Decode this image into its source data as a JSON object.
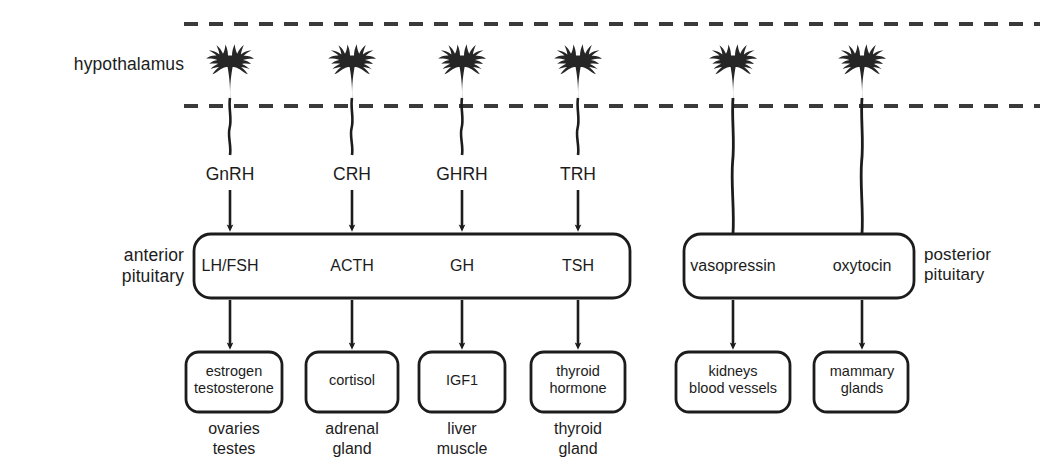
{
  "diagram": {
    "region_labels": {
      "hypothalamus": "hypothalamus",
      "anterior_pituitary": "anterior\npituitary",
      "posterior_pituitary": "posterior\npituitary"
    },
    "colors": {
      "stroke": "#1c1c1c",
      "neuron_fill": "#262626",
      "background": "#ffffff",
      "text": "#1c1c1c"
    },
    "anterior_axis": {
      "columns": [
        {
          "releasing_hormone": "GnRH",
          "pituitary_hormone": "LH/FSH",
          "target_hormone": "estrogen\ntestosterone",
          "target_organ": "ovaries\ntestes",
          "x": 230
        },
        {
          "releasing_hormone": "CRH",
          "pituitary_hormone": "ACTH",
          "target_hormone": "cortisol",
          "target_organ": "adrenal\ngland",
          "x": 352
        },
        {
          "releasing_hormone": "GHRH",
          "pituitary_hormone": "GH",
          "target_hormone": "IGF1",
          "target_organ": "liver\nmuscle",
          "x": 462
        },
        {
          "releasing_hormone": "TRH",
          "pituitary_hormone": "TSH",
          "target_hormone": "thyroid\nhormone",
          "target_organ": "thyroid\ngland",
          "x": 578
        }
      ]
    },
    "posterior_axis": {
      "columns": [
        {
          "pituitary_hormone": "vasopressin",
          "target_organ_box": "kidneys\nblood vessels",
          "x": 733
        },
        {
          "pituitary_hormone": "oxytocin",
          "target_organ_box": "mammary\nglands",
          "x": 862
        }
      ]
    }
  }
}
